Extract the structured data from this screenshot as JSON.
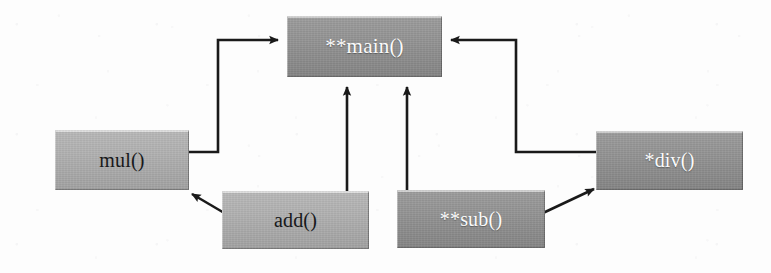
{
  "diagram": {
    "background_color": "#fdfdfd",
    "edge_color": "#1a1a1a",
    "nodes": [
      {
        "id": "main",
        "label": "**main()",
        "x": 287,
        "y": 16,
        "w": 155,
        "h": 61,
        "style": "dark",
        "text_color": "#fbfbfb",
        "fill_color": "#949494",
        "font_size": 21
      },
      {
        "id": "mul",
        "label": "mul()",
        "x": 55,
        "y": 130,
        "w": 134,
        "h": 60,
        "style": "light",
        "text_color": "#17181a",
        "fill_color": "#b2b2b2",
        "font_size": 20
      },
      {
        "id": "div",
        "label": "*div()",
        "x": 596,
        "y": 131,
        "w": 147,
        "h": 59,
        "style": "dark",
        "text_color": "#fbfbfb",
        "fill_color": "#949494",
        "font_size": 20
      },
      {
        "id": "add",
        "label": "add()",
        "x": 222,
        "y": 191,
        "w": 147,
        "h": 58,
        "style": "light",
        "text_color": "#17181a",
        "fill_color": "#b2b2b2",
        "font_size": 20
      },
      {
        "id": "sub",
        "label": "**sub()",
        "x": 397,
        "y": 190,
        "w": 148,
        "h": 58,
        "style": "dark",
        "text_color": "#fbfbfb",
        "fill_color": "#949494",
        "font_size": 20
      }
    ],
    "edges": [
      {
        "id": "mul-to-main",
        "from": "mul",
        "to": "main",
        "kind": "orthogonal",
        "arrow_at": "main-left",
        "points": "189,152 218,152 218,40 279,40"
      },
      {
        "id": "div-to-main",
        "from": "div",
        "to": "main",
        "kind": "orthogonal",
        "arrow_at": "main-right",
        "points": "596,152 516,152 516,40 450,40"
      },
      {
        "id": "add-to-main",
        "from": "add",
        "to": "main",
        "kind": "vertical",
        "arrow_at": "main-bottom",
        "points": "347,192 347,85"
      },
      {
        "id": "sub-to-main",
        "from": "sub",
        "to": "main",
        "kind": "vertical",
        "arrow_at": "main-bottom",
        "points": "407,191 407,85"
      },
      {
        "id": "add-to-mul",
        "from": "add",
        "to": "mul",
        "kind": "diagonal",
        "arrow_at": "mul-bottom-right",
        "points": "224,212 189,192"
      },
      {
        "id": "sub-to-div",
        "from": "sub",
        "to": "div",
        "kind": "diagonal",
        "arrow_at": "div-bottom-left",
        "points": "545,212 597,188"
      }
    ]
  }
}
